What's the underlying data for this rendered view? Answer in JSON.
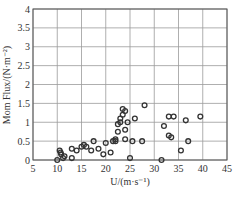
{
  "chart_data": {
    "type": "scatter",
    "title": "",
    "xlabel": "U/(m·s⁻¹)",
    "ylabel": "Mom Flux/(N·m⁻²)",
    "xlim": [
      5,
      45
    ],
    "ylim": [
      0,
      4
    ],
    "xticks": [
      "5",
      "10",
      "15",
      "20",
      "25",
      "30",
      "35",
      "40",
      "45"
    ],
    "yticks": [
      "0",
      "0.5",
      "1",
      "1.5",
      "2",
      "2.5",
      "3",
      "3.5",
      "4"
    ],
    "grid": true,
    "legend": null,
    "marker": "open-circle",
    "series": [
      {
        "name": "Mom Flux",
        "points": [
          [
            10.0,
            0.0
          ],
          [
            10.5,
            0.25
          ],
          [
            10.7,
            0.2
          ],
          [
            10.8,
            0.15
          ],
          [
            11.2,
            0.05
          ],
          [
            11.5,
            0.1
          ],
          [
            13.0,
            0.05
          ],
          [
            13.0,
            0.3
          ],
          [
            14.0,
            0.25
          ],
          [
            15.0,
            0.35
          ],
          [
            15.5,
            0.4
          ],
          [
            16.0,
            0.35
          ],
          [
            17.0,
            0.25
          ],
          [
            17.5,
            0.5
          ],
          [
            18.5,
            0.3
          ],
          [
            19.5,
            0.15
          ],
          [
            20.0,
            0.45
          ],
          [
            21.0,
            0.2
          ],
          [
            21.5,
            0.5
          ],
          [
            22.0,
            0.5
          ],
          [
            22.0,
            0.55
          ],
          [
            22.5,
            0.75
          ],
          [
            22.5,
            0.95
          ],
          [
            23.0,
            1.1
          ],
          [
            23.0,
            1.0
          ],
          [
            23.5,
            1.2
          ],
          [
            23.5,
            1.35
          ],
          [
            24.0,
            1.3
          ],
          [
            24.0,
            0.8
          ],
          [
            24.0,
            0.55
          ],
          [
            25.0,
            0.05
          ],
          [
            24.5,
            1.0
          ],
          [
            25.5,
            0.5
          ],
          [
            26.0,
            1.1
          ],
          [
            27.5,
            0.5
          ],
          [
            28.0,
            1.45
          ],
          [
            31.5,
            0.0
          ],
          [
            32.0,
            0.9
          ],
          [
            33.0,
            0.65
          ],
          [
            33.5,
            0.6
          ],
          [
            33.0,
            1.15
          ],
          [
            34.0,
            1.15
          ],
          [
            35.5,
            0.25
          ],
          [
            36.5,
            1.05
          ],
          [
            37.0,
            0.5
          ],
          [
            39.5,
            1.15
          ]
        ]
      }
    ]
  }
}
